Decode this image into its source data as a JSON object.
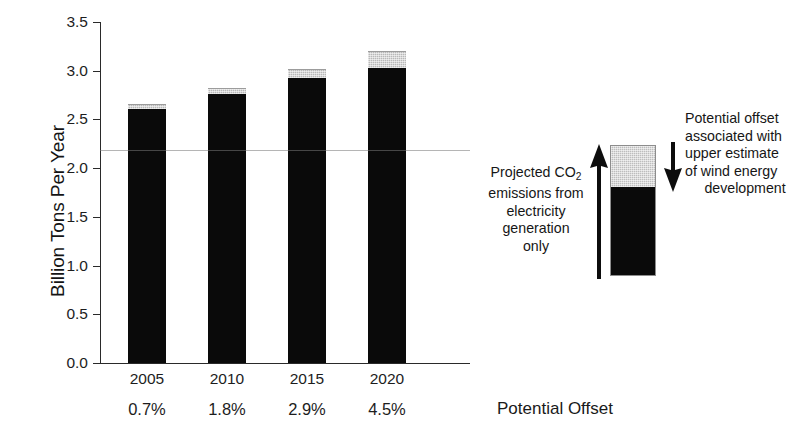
{
  "chart_data": {
    "type": "bar",
    "title": "",
    "subtitle": "",
    "xlabel": "Potential Offset",
    "ylabel": "Billion Tons Per Year",
    "ylim": [
      0.0,
      3.5
    ],
    "ytick_labels": [
      "3.5",
      "3.0",
      "2.5",
      "2.0",
      "1.5",
      "1.0",
      "0.5",
      "0.0"
    ],
    "ytick_values": [
      3.5,
      3.0,
      2.5,
      2.0,
      1.5,
      1.0,
      0.5,
      0.0
    ],
    "grid": false,
    "legend_position": "right",
    "stacked": true,
    "categories": [
      "2005",
      "2010",
      "2015",
      "2020"
    ],
    "secondary_category_labels": [
      "0.7%",
      "1.8%",
      "2.9%",
      "4.5%"
    ],
    "series": [
      {
        "name": "Projected CO2 emissions from electricity generation only",
        "color": "#0a0a0a",
        "values": [
          2.61,
          2.76,
          2.93,
          3.03
        ]
      },
      {
        "name": "Potential offset associated with upper estimate of wind energy development",
        "color": "#b9b9b9",
        "values": [
          0.04,
          0.05,
          0.08,
          0.16
        ]
      }
    ],
    "totals": [
      2.65,
      2.81,
      3.01,
      3.19
    ],
    "annotations": [
      "Projected CO2 emissions from electricity generation only",
      "Potential offset associated with upper estimate of wind energy development"
    ]
  },
  "axis": {
    "y_title": "Billion Tons Per Year",
    "y_ticks": [
      {
        "label": "3.5",
        "value": 3.5
      },
      {
        "label": "3.0",
        "value": 3.0
      },
      {
        "label": "2.5",
        "value": 2.5
      },
      {
        "label": "2.0",
        "value": 2.0
      },
      {
        "label": "1.5",
        "value": 1.5
      },
      {
        "label": "1.0",
        "value": 1.0
      },
      {
        "label": "0.5",
        "value": 0.5
      },
      {
        "label": "0.0",
        "value": 0.0
      }
    ]
  },
  "bars": [
    {
      "category": "2005",
      "percent": "0.7%",
      "black": 2.61,
      "gray": 0.04,
      "total": 2.65
    },
    {
      "category": "2010",
      "percent": "1.8%",
      "black": 2.76,
      "gray": 0.05,
      "total": 2.81
    },
    {
      "category": "2015",
      "percent": "2.9%",
      "black": 2.93,
      "gray": 0.08,
      "total": 3.01
    },
    {
      "category": "2020",
      "percent": "4.5%",
      "black": 3.03,
      "gray": 0.16,
      "total": 3.19
    }
  ],
  "x_axis_caption": "Potential Offset",
  "legend": {
    "left_text_lines": [
      "Projected CO",
      "emissions from",
      "electricity",
      "generation",
      "only"
    ],
    "left_text_subscript": "2",
    "right_text_lines": [
      "Potential offset",
      "associated with",
      "upper estimate",
      "of wind energy",
      "development"
    ],
    "up_arrow_name": "arrow-up-icon",
    "down_arrow_name": "arrow-down-icon"
  },
  "colors": {
    "emissions_black": "#0a0a0a",
    "offset_gray": "#b9b9b9",
    "axis": "#2a2a2a",
    "text": "#1a1a1a",
    "background": "#ffffff"
  }
}
